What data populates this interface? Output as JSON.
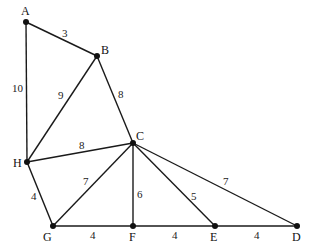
{
  "diagram": {
    "type": "weighted-undirected-graph",
    "vertices": [
      {
        "id": "A",
        "label": "A"
      },
      {
        "id": "B",
        "label": "B"
      },
      {
        "id": "C",
        "label": "C"
      },
      {
        "id": "D",
        "label": "D"
      },
      {
        "id": "E",
        "label": "E"
      },
      {
        "id": "F",
        "label": "F"
      },
      {
        "id": "G",
        "label": "G"
      },
      {
        "id": "H",
        "label": "H"
      }
    ],
    "edges": [
      {
        "from": "A",
        "to": "B",
        "weight": "3"
      },
      {
        "from": "A",
        "to": "H",
        "weight": "10"
      },
      {
        "from": "B",
        "to": "H",
        "weight": "9"
      },
      {
        "from": "B",
        "to": "C",
        "weight": "8"
      },
      {
        "from": "H",
        "to": "C",
        "weight": "8"
      },
      {
        "from": "H",
        "to": "G",
        "weight": "4"
      },
      {
        "from": "G",
        "to": "C",
        "weight": "7"
      },
      {
        "from": "C",
        "to": "F",
        "weight": "6"
      },
      {
        "from": "C",
        "to": "E",
        "weight": "5"
      },
      {
        "from": "C",
        "to": "D",
        "weight": "7"
      },
      {
        "from": "G",
        "to": "F",
        "weight": "4"
      },
      {
        "from": "F",
        "to": "E",
        "weight": "4"
      },
      {
        "from": "E",
        "to": "D",
        "weight": "4"
      }
    ]
  }
}
